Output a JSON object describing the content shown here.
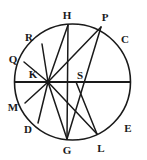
{
  "figure": {
    "type": "geometric-diagram",
    "stroke_color": "#1a1a1a",
    "background_color": "#ffffff",
    "circle": {
      "center_x": 72.5,
      "center_y": 82,
      "radius": 58,
      "stroke_width": 1.6
    },
    "diameter": {
      "name": "horizontal-diameter",
      "x1": 14.5,
      "y1": 82,
      "x2": 130.5,
      "y2": 82,
      "stroke_width": 2.2
    },
    "hub": {
      "x": 48,
      "y": 82
    },
    "node_s": {
      "x": 76,
      "y": 82
    },
    "points": [
      {
        "id": "R",
        "px": 42,
        "py": 44,
        "label_x": 29,
        "label_y": 37
      },
      {
        "id": "H",
        "px": 68,
        "py": 25,
        "label_x": 67,
        "label_y": 15
      },
      {
        "id": "P",
        "px": 101,
        "py": 27,
        "label_x": 105,
        "label_y": 17
      },
      {
        "id": "C",
        "px": 121,
        "py": 44,
        "label_x": 125,
        "label_y": 39
      },
      {
        "id": "Q",
        "px": 24,
        "py": 62,
        "label_x": 13,
        "label_y": 59
      },
      {
        "id": "K",
        "px": 48,
        "py": 82,
        "label_x": 33,
        "label_y": 74
      },
      {
        "id": "S",
        "px": 76,
        "py": 82,
        "label_x": 80,
        "label_y": 75
      },
      {
        "id": "M",
        "px": 25,
        "py": 103,
        "label_x": 13,
        "label_y": 107
      },
      {
        "id": "D",
        "px": 38,
        "py": 123,
        "label_x": 28,
        "label_y": 129
      },
      {
        "id": "G",
        "px": 67,
        "py": 139,
        "label_x": 67,
        "label_y": 150
      },
      {
        "id": "L",
        "px": 97,
        "py": 134,
        "label_x": 101,
        "label_y": 148
      },
      {
        "id": "E",
        "px": 120,
        "py": 119,
        "label_x": 128,
        "label_y": 128
      }
    ],
    "chords": [
      {
        "name": "chord-K-R",
        "x1": 48,
        "y1": 82,
        "x2": 42,
        "y2": 44
      },
      {
        "name": "chord-K-Q",
        "x1": 48,
        "y1": 82,
        "x2": 24,
        "y2": 62
      },
      {
        "name": "chord-K-H",
        "x1": 48,
        "y1": 82,
        "x2": 68,
        "y2": 25
      },
      {
        "name": "chord-K-P",
        "x1": 48,
        "y1": 82,
        "x2": 101,
        "y2": 27
      },
      {
        "name": "chord-K-M",
        "x1": 48,
        "y1": 82,
        "x2": 25,
        "y2": 103
      },
      {
        "name": "chord-K-D",
        "x1": 48,
        "y1": 82,
        "x2": 38,
        "y2": 123
      },
      {
        "name": "chord-K-G",
        "x1": 48,
        "y1": 82,
        "x2": 67,
        "y2": 139
      },
      {
        "name": "chord-K-L",
        "x1": 48,
        "y1": 82,
        "x2": 97,
        "y2": 134
      },
      {
        "name": "chord-H-G",
        "x1": 68,
        "y1": 25,
        "x2": 67,
        "y2": 139
      },
      {
        "name": "chord-P-S-G",
        "x1": 101,
        "y1": 27,
        "x2": 67,
        "y2": 139
      },
      {
        "name": "chord-S-L",
        "x1": 76,
        "y1": 82,
        "x2": 97,
        "y2": 134
      }
    ]
  }
}
